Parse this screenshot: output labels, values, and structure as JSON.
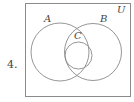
{
  "problem_number": "4.",
  "diagram": {
    "type": "venn",
    "universe_label": "U",
    "sets": [
      {
        "name": "A",
        "label": "A",
        "cx": 60,
        "cy": 52,
        "r": 29
      },
      {
        "name": "B",
        "label": "B",
        "cx": 93,
        "cy": 52,
        "r": 28.5
      },
      {
        "name": "C",
        "label": "C",
        "cx": 78.5,
        "cy": 55.5,
        "r": 13.5
      }
    ],
    "relations": "C is a subset of the intersection of A and B",
    "line_color": "#8a8a8a"
  }
}
